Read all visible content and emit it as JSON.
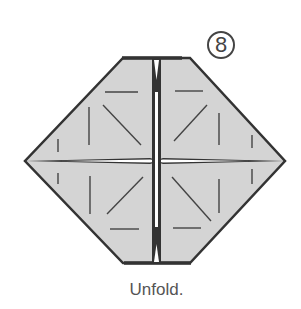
{
  "diagram": {
    "step_number": "8",
    "caption": "Unfold.",
    "colors": {
      "paper": "#d6d6d6",
      "outline": "#333333",
      "crease": "#444444",
      "background": "#ffffff"
    },
    "shape": "hexagon (folded square base) with four flaps meeting at center cross",
    "crease_marks": "short straight and diagonal crease lines in each quadrant"
  }
}
